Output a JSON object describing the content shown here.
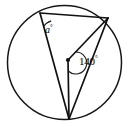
{
  "figure": {
    "kind": "circle-geometry-diagram",
    "width": 129,
    "height": 127,
    "background_color": "#ffffff",
    "stroke_color": "#111111"
  },
  "labels": {
    "inscribed_angle": {
      "value": "a",
      "degree_symbol": "°",
      "full": "a°",
      "at_vertex": "A"
    },
    "central_angle": {
      "value": "140",
      "degree_symbol": "°",
      "full": "140°",
      "at_vertex": "O"
    }
  },
  "geometry": {
    "circle": {
      "cx": 64.5,
      "cy": 62.5,
      "r": 57.5
    },
    "points": {
      "A": {
        "x": 40,
        "y": 13,
        "role": "inscribed-angle-vertex"
      },
      "B": {
        "x": 108,
        "y": 18,
        "role": "circle-point-right"
      },
      "C": {
        "x": 69,
        "y": 119,
        "role": "circle-point-bottom"
      },
      "O": {
        "x": 68,
        "y": 60,
        "role": "center"
      }
    },
    "segments": [
      {
        "name": "chord-AB",
        "from": "A",
        "to": "B"
      },
      {
        "name": "chord-AC",
        "from": "A",
        "to": "C"
      },
      {
        "name": "chord-BC",
        "from": "B",
        "to": "C"
      },
      {
        "name": "radius-OB",
        "from": "O",
        "to": "B"
      },
      {
        "name": "radius-OC",
        "from": "O",
        "to": "C"
      }
    ],
    "arcs": [
      {
        "name": "arc-at-A",
        "vertex": "A",
        "radius": 14
      },
      {
        "name": "arc-at-O",
        "vertex": "O",
        "radius": 11
      }
    ]
  }
}
